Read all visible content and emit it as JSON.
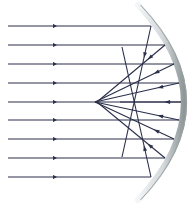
{
  "diagram": {
    "width": 191,
    "height": 204,
    "colors": {
      "ray": "#2a2f4a",
      "mirror_light": "#f2f4f5",
      "mirror_dark": "#8e9698",
      "background": "#ffffff"
    },
    "incident_rays": [
      {
        "y": 26,
        "x_start": 8,
        "x_hit": 151,
        "arrow_x": 55
      },
      {
        "y": 45,
        "x_start": 8,
        "x_hit": 165,
        "arrow_x": 55
      },
      {
        "y": 64,
        "x_start": 8,
        "x_hit": 174,
        "arrow_x": 55
      },
      {
        "y": 83,
        "x_start": 8,
        "x_hit": 179,
        "arrow_x": 55
      },
      {
        "y": 102,
        "x_start": 8,
        "x_hit": 181,
        "arrow_x": 55
      },
      {
        "y": 120,
        "x_start": 8,
        "x_hit": 179,
        "arrow_x": 55
      },
      {
        "y": 139,
        "x_start": 8,
        "x_hit": 174,
        "arrow_x": 55
      },
      {
        "y": 158,
        "x_start": 8,
        "x_hit": 165,
        "arrow_x": 55
      },
      {
        "y": 177,
        "x_start": 8,
        "x_hit": 151,
        "arrow_x": 55
      }
    ],
    "reflected_rays": [
      {
        "from": [
          151,
          26
        ],
        "to": [
          122,
          157
        ]
      },
      {
        "from": [
          165,
          45
        ],
        "to": [
          97,
          102
        ]
      },
      {
        "from": [
          174,
          64
        ],
        "to": [
          95,
          102
        ]
      },
      {
        "from": [
          179,
          83
        ],
        "to": [
          95,
          102
        ]
      },
      {
        "from": [
          181,
          102
        ],
        "to": [
          120,
          102
        ]
      },
      {
        "from": [
          179,
          120
        ],
        "to": [
          95,
          102
        ]
      },
      {
        "from": [
          174,
          139
        ],
        "to": [
          95,
          102
        ]
      },
      {
        "from": [
          165,
          158
        ],
        "to": [
          97,
          102
        ]
      },
      {
        "from": [
          151,
          177
        ],
        "to": [
          122,
          47
        ]
      }
    ],
    "mirror": {
      "type": "concave",
      "top": [
        138,
        5
      ],
      "bottom": [
        138,
        200
      ],
      "apex_x": 184
    }
  }
}
